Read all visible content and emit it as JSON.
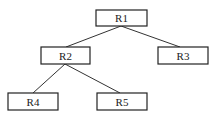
{
  "diagram": {
    "type": "tree",
    "nodes": [
      {
        "id": "R1",
        "label": "R1",
        "x": 96,
        "y": 10,
        "w": 51,
        "h": 16
      },
      {
        "id": "R2",
        "label": "R2",
        "x": 41,
        "y": 47,
        "w": 49,
        "h": 17
      },
      {
        "id": "R3",
        "label": "R3",
        "x": 158,
        "y": 47,
        "w": 50,
        "h": 17
      },
      {
        "id": "R4",
        "label": "R4",
        "x": 8,
        "y": 93,
        "w": 50,
        "h": 17
      },
      {
        "id": "R5",
        "label": "R5",
        "x": 97,
        "y": 93,
        "w": 50,
        "h": 17
      }
    ],
    "edges": [
      {
        "from": "R1",
        "to": "R2"
      },
      {
        "from": "R1",
        "to": "R3"
      },
      {
        "from": "R2",
        "to": "R4"
      },
      {
        "from": "R2",
        "to": "R5"
      }
    ]
  }
}
